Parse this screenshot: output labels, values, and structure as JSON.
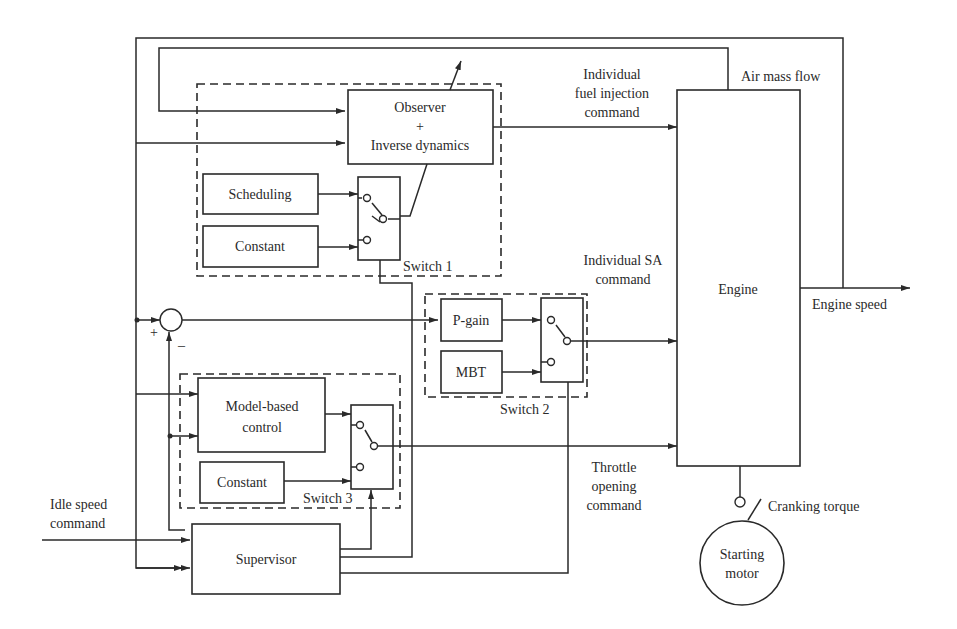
{
  "diagram": {
    "blocks": {
      "observer": {
        "line1": "Observer",
        "line2": "+",
        "line3": "Inverse dynamics"
      },
      "scheduling": "Scheduling",
      "constant1": "Constant",
      "switch1": "Switch 1",
      "pgain": "P-gain",
      "mbt": "MBT",
      "switch2": "Switch 2",
      "model_based": {
        "line1": "Model-based",
        "line2": "control"
      },
      "constant3": "Constant",
      "switch3": "Switch 3",
      "supervisor": "Supervisor",
      "engine": "Engine",
      "starting_motor": {
        "line1": "Starting",
        "line2": "motor"
      }
    },
    "signals": {
      "fuel_injection": {
        "line1": "Individual",
        "line2": "fuel injection",
        "line3": "command"
      },
      "air_mass_flow": "Air mass flow",
      "sa_command": {
        "line1": "Individual SA",
        "line2": "command"
      },
      "engine_speed": "Engine speed",
      "throttle": {
        "line1": "Throttle",
        "line2": "opening",
        "line3": "command"
      },
      "idle_speed": {
        "line1": "Idle speed",
        "line2": "command"
      },
      "cranking_torque": "Cranking torque"
    },
    "summing_junction": {
      "plus": "+",
      "minus": "–"
    }
  }
}
